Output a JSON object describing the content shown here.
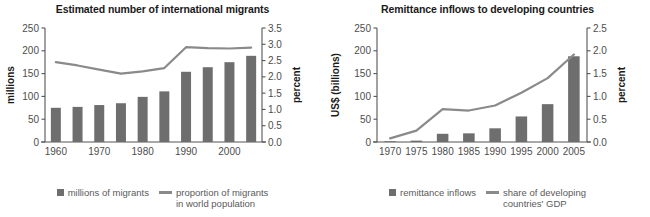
{
  "colors": {
    "bar": "#6e6e6e",
    "line": "#8a8a8a",
    "axis": "#555555",
    "title_text": "#1a1a1a",
    "tick_text": "#4d4d4d",
    "legend_text": "#5a5a5a",
    "background": "#ffffff"
  },
  "chart_data": [
    {
      "type": "bar",
      "id": "international-migrants",
      "title": "Estimated number of international migrants",
      "xlabel": "",
      "ylabel": "millions",
      "y2label": "percent",
      "categories": [
        "1960",
        "1965",
        "1970",
        "1975",
        "1980",
        "1985",
        "1990",
        "1995",
        "2000",
        "2005"
      ],
      "tick_labels_shown": [
        "1960",
        "1970",
        "1980",
        "1990",
        "2000"
      ],
      "ylim": [
        0,
        250
      ],
      "yticks": [
        0,
        50,
        100,
        150,
        200,
        250
      ],
      "ytick_labels": [
        "0",
        "50",
        "100",
        "150",
        "200",
        "250"
      ],
      "y2lim": [
        0.0,
        3.5
      ],
      "y2ticks": [
        0.0,
        0.5,
        1.0,
        1.5,
        2.0,
        2.5,
        3.0,
        3.5
      ],
      "y2tick_labels": [
        "0.0",
        "0.5",
        "1.0",
        "1.5",
        "2.0",
        "2.5",
        "3.0",
        "3.5"
      ],
      "grid": false,
      "legend_position": "bottom",
      "series": [
        {
          "name": "millions of migrants",
          "kind": "bar",
          "axis": "left",
          "values": [
            75,
            77,
            81,
            85,
            99,
            111,
            154,
            164,
            175,
            189
          ]
        },
        {
          "name": "proportion of migrants in world population",
          "kind": "line",
          "axis": "right",
          "values": [
            2.45,
            2.35,
            2.22,
            2.1,
            2.17,
            2.27,
            2.91,
            2.88,
            2.87,
            2.9
          ]
        }
      ]
    },
    {
      "type": "bar",
      "id": "remittance-inflows",
      "title": "Remittance inflows to developing countries",
      "xlabel": "",
      "ylabel": "US$ (billions)",
      "y2label": "percent",
      "categories": [
        "1970",
        "1975",
        "1980",
        "1985",
        "1990",
        "1995",
        "2000",
        "2005"
      ],
      "tick_labels_shown": [
        "1970",
        "1975",
        "1980",
        "1985",
        "1990",
        "1995",
        "2000",
        "2005"
      ],
      "ylim": [
        0,
        250
      ],
      "yticks": [
        0,
        50,
        100,
        150,
        200,
        250
      ],
      "ytick_labels": [
        "0",
        "50",
        "100",
        "150",
        "200",
        "250"
      ],
      "y2lim": [
        0.0,
        2.5
      ],
      "y2ticks": [
        0.0,
        0.5,
        1.0,
        1.5,
        2.0,
        2.5
      ],
      "y2tick_labels": [
        "0.0",
        "0.5",
        "1.0",
        "1.5",
        "2.0",
        "2.5"
      ],
      "grid": false,
      "legend_position": "bottom",
      "series": [
        {
          "name": "remittance inflows",
          "kind": "bar",
          "axis": "left",
          "values": [
            1,
            3,
            18,
            19,
            30,
            56,
            83,
            188
          ]
        },
        {
          "name": "share of developing countries' GDP",
          "kind": "line",
          "axis": "right",
          "values": [
            0.08,
            0.25,
            0.72,
            0.69,
            0.8,
            1.08,
            1.4,
            1.92
          ]
        }
      ]
    }
  ],
  "left_panel": {
    "title": "Estimated number of international migrants",
    "y_axis_title": "millions",
    "y2_axis_title": "percent",
    "legend": {
      "bar_label": "millions of migrants",
      "line_label": "proportion of migrants\nin world population"
    }
  },
  "right_panel": {
    "title": "Remittance inflows to developing countries",
    "y_axis_title": "US$ (billions)",
    "y2_axis_title": "percent",
    "legend": {
      "bar_label": "remittance inflows",
      "line_label": "share of developing\ncountries' GDP"
    }
  }
}
